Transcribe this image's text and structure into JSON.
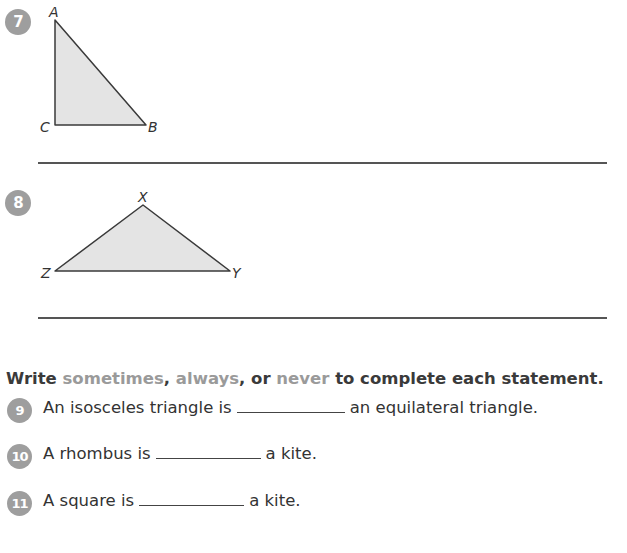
{
  "problems": [
    {
      "number": "7",
      "type": "figure",
      "figure": {
        "shape": "right-triangle",
        "vertices": [
          {
            "label": "A",
            "x": 55,
            "y": 20
          },
          {
            "label": "B",
            "x": 146,
            "y": 125
          },
          {
            "label": "C",
            "x": 55,
            "y": 125
          }
        ]
      }
    },
    {
      "number": "8",
      "type": "figure",
      "figure": {
        "shape": "obtuse-triangle",
        "vertices": [
          {
            "label": "X",
            "x": 143,
            "y": 205
          },
          {
            "label": "Y",
            "x": 230,
            "y": 271
          },
          {
            "label": "Z",
            "x": 55,
            "y": 271
          }
        ]
      }
    }
  ],
  "instruction": {
    "write": "Write",
    "kw1": "sometimes",
    "sep1": ",",
    "kw2": "always",
    "sep2": ", or",
    "kw3": "never",
    "rest": "to complete each statement."
  },
  "statements": [
    {
      "number": "9",
      "before": "An isosceles triangle is",
      "after": "an equilateral triangle."
    },
    {
      "number": "10",
      "before": "A rhombus is",
      "after": "a kite."
    },
    {
      "number": "11",
      "before": "A square is",
      "after": "a kite."
    }
  ],
  "colors": {
    "badge": "#9e9e9e",
    "shape_fill": "#e4e4e4",
    "shape_stroke": "#3a3a3a",
    "keyword": "#9a9a9a",
    "text": "#333333"
  }
}
